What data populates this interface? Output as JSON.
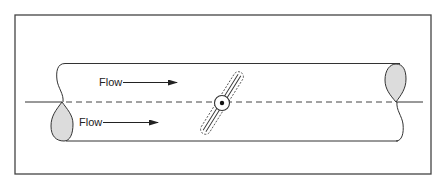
{
  "diagram": {
    "type": "butterfly-valve-in-pipe",
    "labels": {
      "flow_upper": "Flow",
      "flow_lower": "Flow"
    },
    "colors": {
      "stroke": "#333333",
      "shade": "#d9d9d9",
      "background": "#ffffff"
    }
  }
}
